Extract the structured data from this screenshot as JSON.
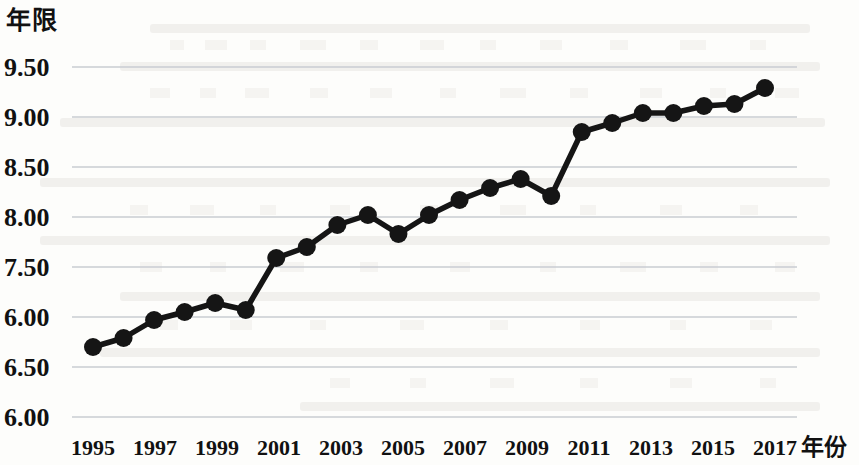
{
  "axis": {
    "y_caption": "年限",
    "x_caption": "年份",
    "y_tick_labels": [
      "9.50",
      "9.00",
      "8.50",
      "8.00",
      "7.50",
      "6.00",
      "6.50",
      "6.00"
    ],
    "x_tick_labels": [
      "1995",
      "1997",
      "1999",
      "2001",
      "2003",
      "2005",
      "2007",
      "2009",
      "2011",
      "2013",
      "2015",
      "2017"
    ]
  },
  "style": {
    "line_color": "#151515",
    "marker_color": "#151515",
    "grid_color": "#c9cdd2",
    "page_background": "#fdfdfb"
  },
  "chart_data": {
    "type": "line",
    "title": "",
    "subtitle": "",
    "xlabel": "年份",
    "ylabel": "年限",
    "grid": true,
    "legend": "none",
    "xlim": [
      1995,
      2017
    ],
    "ylim": [
      6.0,
      9.5
    ],
    "y_tick_values": [
      9.5,
      9.0,
      8.5,
      8.0,
      7.5,
      7.0,
      6.5,
      6.0
    ],
    "y_tick_labels_as_printed": [
      "9.50",
      "9.00",
      "8.50",
      "8.00",
      "7.50",
      "6.00",
      "6.50",
      "6.00"
    ],
    "x_tick_values": [
      1995,
      1997,
      1999,
      2001,
      2003,
      2005,
      2007,
      2009,
      2011,
      2013,
      2015,
      2017
    ],
    "x": [
      1995,
      1996,
      1997,
      1998,
      1999,
      2000,
      2001,
      2002,
      2003,
      2004,
      2005,
      2006,
      2007,
      2008,
      2009,
      2010,
      2011,
      2012,
      2013,
      2014,
      2015,
      2016,
      2017
    ],
    "series": [
      {
        "name": "平均受教育年限",
        "values": [
          6.7,
          6.79,
          6.97,
          7.05,
          7.14,
          7.07,
          7.59,
          7.7,
          7.92,
          8.02,
          7.83,
          8.02,
          8.17,
          8.29,
          8.38,
          8.21,
          8.85,
          8.94,
          9.04,
          9.04,
          9.11,
          9.13,
          9.29
        ]
      }
    ]
  }
}
